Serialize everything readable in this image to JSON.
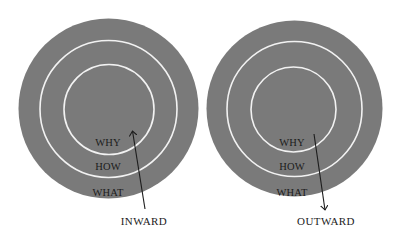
{
  "colors": {
    "disc": "#7a7a7a",
    "ring": "#f2f2f2",
    "text": "#1c1c1c",
    "background": "#ffffff"
  },
  "diagrams": [
    {
      "id": "inward",
      "rings": [
        "WHY",
        "HOW",
        "WHAT"
      ],
      "arrow_direction": "up",
      "caption": "INWARD"
    },
    {
      "id": "outward",
      "rings": [
        "WHY",
        "HOW",
        "WHAT"
      ],
      "arrow_direction": "down",
      "caption": "OUTWARD"
    }
  ]
}
